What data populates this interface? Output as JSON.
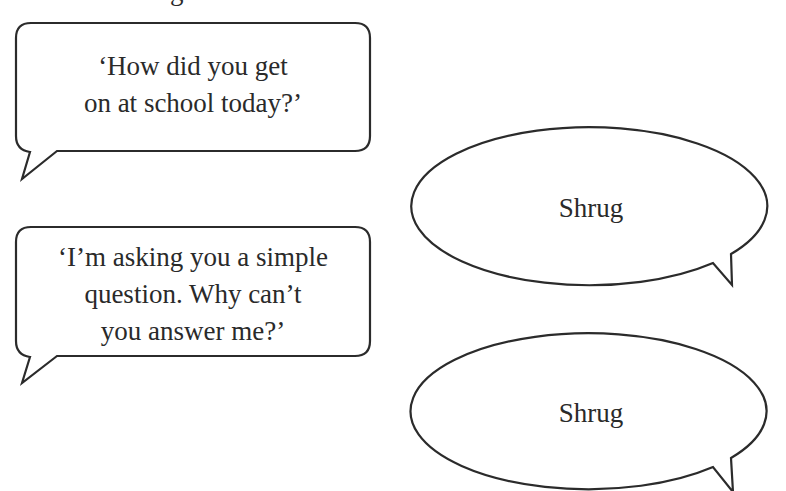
{
  "header": {
    "clipped_heading_fragment": "g"
  },
  "bubbles": [
    {
      "shape": "rounded-rectangle",
      "speaker": "parent",
      "lines": [
        "‘How did you get",
        "on at school today?’"
      ]
    },
    {
      "shape": "ellipse",
      "speaker": "child",
      "lines": [
        "Shrug"
      ]
    },
    {
      "shape": "rounded-rectangle",
      "speaker": "parent",
      "lines": [
        "‘I’m asking you a simple",
        "question. Why can’t",
        "you answer me?’"
      ]
    },
    {
      "shape": "ellipse",
      "speaker": "child",
      "lines": [
        "Shrug"
      ]
    }
  ],
  "colors": {
    "stroke": "#2b2b2b",
    "text": "#2a2a2a",
    "background": "#ffffff"
  }
}
